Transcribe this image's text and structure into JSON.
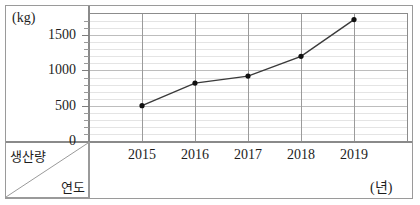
{
  "chart_data": {
    "type": "line",
    "title": "",
    "xlabel": "연도",
    "ylabel": "생산량",
    "x_unit": "(년)",
    "y_unit": "(kg)",
    "categories": [
      "2015",
      "2016",
      "2017",
      "2018",
      "2019"
    ],
    "values": [
      500,
      820,
      920,
      1200,
      1720
    ],
    "series": [
      {
        "name": "생산량",
        "values": [
          500,
          820,
          920,
          1200,
          1720
        ]
      }
    ],
    "ylim": [
      0,
      1800
    ],
    "y_major_ticks": [
      "0",
      "500",
      "1000",
      "1500"
    ],
    "y_major_values": [
      0,
      500,
      1000,
      1500
    ],
    "y_minor_step": 100,
    "grid": true,
    "legend": "none",
    "marker": "filled-circle",
    "line_color": "#3a3a3a",
    "marker_color": "#111111",
    "grid_color": "#e4e4e4",
    "major_grid_color": "#bdbdbd",
    "axis_color": "#8a8a8a"
  },
  "header_cell": {
    "top_left_label": "생산량",
    "bottom_right_label": "연도"
  },
  "axis_labels": {
    "y_unit": "(kg)",
    "x_unit": "(년)",
    "y_ticks": [
      "1500",
      "1000",
      "500",
      "0"
    ],
    "x_ticks": [
      "2015",
      "2016",
      "2017",
      "2018",
      "2019"
    ]
  }
}
